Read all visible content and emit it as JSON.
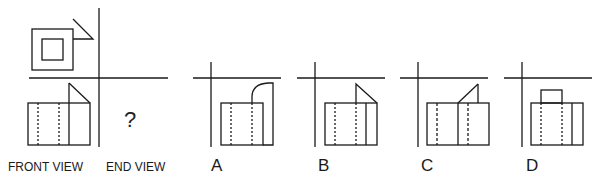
{
  "question_mark": "?",
  "labels": {
    "front_view": "FRONT VIEW",
    "end_view": "END VIEW",
    "options": [
      "A",
      "B",
      "C",
      "D"
    ]
  },
  "colors": {
    "line": "#1a1a1a",
    "background": "#ffffff"
  }
}
